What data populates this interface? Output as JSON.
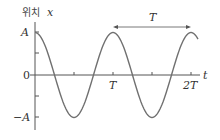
{
  "figure": {
    "y_axis_label_korean": "위치",
    "y_axis_label_var": "x",
    "x_axis_label": "t",
    "period_label": "T",
    "y_ticks": {
      "top": "A",
      "zero": "0",
      "bottom": "−A"
    },
    "x_ticks": {
      "t1": "T",
      "t2": "2T"
    },
    "colors": {
      "curve": "#707070",
      "axis": "#555555",
      "text": "#333333"
    }
  },
  "chart_data": {
    "type": "line",
    "title": "",
    "xlabel": "t",
    "ylabel": "위치 x",
    "function": "x(t) = A cos(2πt/T)",
    "x_tick_labels": [
      "T",
      "2T"
    ],
    "y_tick_labels": [
      "A",
      "0",
      "−A"
    ],
    "x": [
      0,
      0.25,
      0.5,
      0.75,
      1.0,
      1.25,
      1.5,
      1.75,
      2.0,
      2.08
    ],
    "values": [
      1,
      0,
      -1,
      0,
      1,
      0,
      -1,
      0,
      1,
      0.87
    ],
    "ylim": [
      -1,
      1
    ],
    "annotations": [
      {
        "type": "double-arrow",
        "from": 1.0,
        "to": 2.0,
        "label": "T"
      }
    ],
    "grid": false
  }
}
